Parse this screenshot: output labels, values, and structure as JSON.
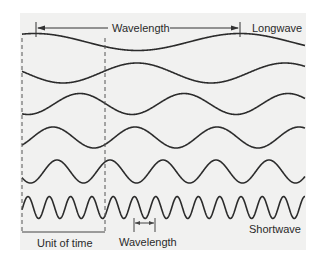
{
  "chart_data": {
    "type": "diagram",
    "title": "",
    "waves": [
      {
        "name": "row-1",
        "center_y": 42,
        "amplitude": 8.5,
        "wavelength": 205,
        "phase_peak_x": 35
      },
      {
        "name": "row-2",
        "center_y": 73,
        "amplitude": 10,
        "wavelength": 148,
        "phase_peak_x": 137
      },
      {
        "name": "row-3",
        "center_y": 104,
        "amplitude": 10.5,
        "wavelength": 104,
        "phase_peak_x": 80
      },
      {
        "name": "row-4",
        "center_y": 137.5,
        "amplitude": 10.5,
        "wavelength": 82,
        "phase_peak_x": 53
      },
      {
        "name": "row-5",
        "center_y": 171.5,
        "amplitude": 11.5,
        "wavelength": 53,
        "phase_peak_x": 57
      },
      {
        "name": "row-6",
        "center_y": 207.5,
        "amplitude": 11,
        "wavelength": 21.3,
        "phase_peak_x": 28
      }
    ],
    "x_range": [
      22,
      305
    ],
    "unit_of_time": {
      "x_start": 22,
      "x_end": 105,
      "y_top": 38,
      "y_bottom": 232
    },
    "labels": {
      "top_wavelength": "Wavelength",
      "longwave": "Longwave",
      "shortwave": "Shortwave",
      "unit_of_time": "Unit of time",
      "bottom_wavelength": "Wavelength"
    }
  },
  "colors": {
    "wave": "#2b2b2b",
    "panel": "#f1f1f0",
    "text": "#2a2a2a"
  }
}
